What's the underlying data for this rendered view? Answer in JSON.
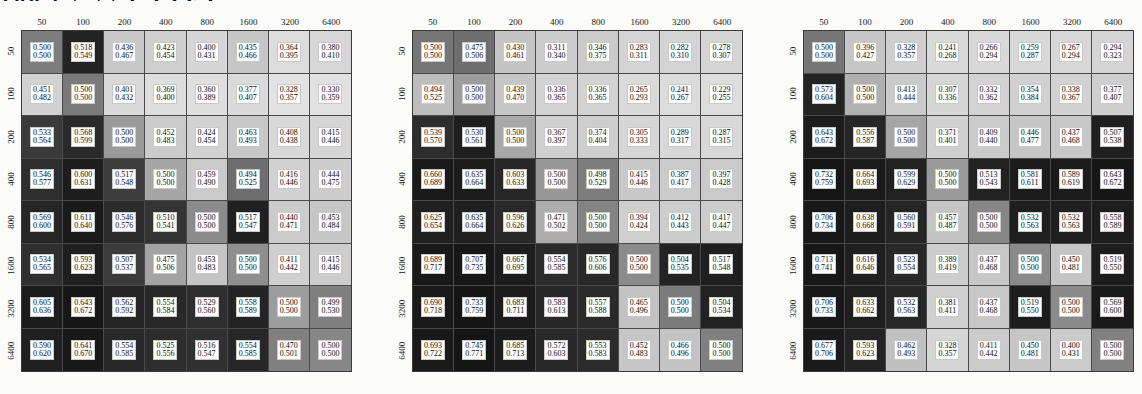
{
  "top_text_fragment": "100   67 77 GTTET",
  "axis": {
    "column_labels": [
      "50",
      "100",
      "200",
      "400",
      "800",
      "1600",
      "3200",
      "6400"
    ],
    "row_labels": [
      "50",
      "100",
      "200",
      "400",
      "800",
      "1600",
      "3200",
      "6400"
    ]
  },
  "chart_data": [
    {
      "type": "heatmap",
      "title": "",
      "xlabel": "",
      "ylabel": "",
      "categories": [
        "50",
        "100",
        "200",
        "400",
        "800",
        "1600",
        "3200",
        "6400"
      ],
      "rows": [
        "50",
        "100",
        "200",
        "400",
        "800",
        "1600",
        "3200",
        "6400"
      ],
      "cell_text_top": [
        [
          "0.500",
          "0.518",
          "0.436",
          "0.423",
          "0.400",
          "0.435",
          "0.364",
          "0.380"
        ],
        [
          "0.451",
          "0.500",
          "0.401",
          "0.369",
          "0.360",
          "0.377",
          "0.328",
          "0.330"
        ],
        [
          "0.533",
          "0.568",
          "0.500",
          "0.452",
          "0.424",
          "0.463",
          "0.408",
          "0.415"
        ],
        [
          "0.546",
          "0.600",
          "0.517",
          "0.500",
          "0.459",
          "0.494",
          "0.416",
          "0.444"
        ],
        [
          "0.569",
          "0.611",
          "0.546",
          "0.510",
          "0.500",
          "0.517",
          "0.440",
          "0.453"
        ],
        [
          "0.534",
          "0.593",
          "0.507",
          "0.475",
          "0.453",
          "0.500",
          "0.411",
          "0.415"
        ],
        [
          "0.605",
          "0.643",
          "0.562",
          "0.554",
          "0.529",
          "0.558",
          "0.500",
          "0.499"
        ],
        [
          "0.590",
          "0.641",
          "0.554",
          "0.525",
          "0.516",
          "0.554",
          "0.470",
          "0.500"
        ]
      ],
      "cell_text_bottom": [
        [
          "0.500",
          "0.549",
          "0.467",
          "0.454",
          "0.431",
          "0.466",
          "0.395",
          "0.410"
        ],
        [
          "0.482",
          "0.500",
          "0.432",
          "0.400",
          "0.389",
          "0.407",
          "0.357",
          "0.359"
        ],
        [
          "0.564",
          "0.599",
          "0.500",
          "0.483",
          "0.454",
          "0.493",
          "0.438",
          "0.446"
        ],
        [
          "0.577",
          "0.631",
          "0.548",
          "0.500",
          "0.490",
          "0.525",
          "0.446",
          "0.475"
        ],
        [
          "0.600",
          "0.640",
          "0.576",
          "0.541",
          "0.500",
          "0.547",
          "0.471",
          "0.484"
        ],
        [
          "0.565",
          "0.623",
          "0.537",
          "0.506",
          "0.483",
          "0.500",
          "0.442",
          "0.446"
        ],
        [
          "0.636",
          "0.672",
          "0.592",
          "0.584",
          "0.560",
          "0.589",
          "0.500",
          "0.530"
        ],
        [
          "0.620",
          "0.670",
          "0.585",
          "0.556",
          "0.547",
          "0.585",
          "0.501",
          "0.500"
        ]
      ],
      "cell_colors": [
        [
          "#7d7d7d",
          "#232323",
          "#c8c8c8",
          "#cfcfcf",
          "#d6d6d6",
          "#c6c6c6",
          "#dcdcdc",
          "#d7d7d7"
        ],
        [
          "#d2d2d2",
          "#7a7a7a",
          "#d9d9d9",
          "#dedede",
          "#dfdfdf",
          "#dadada",
          "#e2e2e2",
          "#e1e1e1"
        ],
        [
          "#3a3a3a",
          "#2a2a2a",
          "#9a9a9a",
          "#cbcbcb",
          "#d2d2d2",
          "#c7c7c7",
          "#d8d8d8",
          "#d5d5d5"
        ],
        [
          "#2e2e2e",
          "#1d1d1d",
          "#3e3e3e",
          "#a6a6a6",
          "#cacaca",
          "#6e6e6e",
          "#d2d2d2",
          "#cdcdcd"
        ],
        [
          "#262626",
          "#1a1a1a",
          "#2b2b2b",
          "#343434",
          "#8b8b8b",
          "#202020",
          "#cbcbcb",
          "#c6c6c6"
        ],
        [
          "#2f2f2f",
          "#1f1f1f",
          "#3b3b3b",
          "#a3a3a3",
          "#c4c4c4",
          "#8e8e8e",
          "#cfcfcf",
          "#cccccc"
        ],
        [
          "#1c1c1c",
          "#171717",
          "#252525",
          "#282828",
          "#2e2e2e",
          "#242424",
          "#9d9d9d",
          "#7f7f7f"
        ],
        [
          "#202020",
          "#181818",
          "#292929",
          "#2d2d2d",
          "#303030",
          "#272727",
          "#808080",
          "#878787"
        ]
      ]
    },
    {
      "type": "heatmap",
      "title": "",
      "xlabel": "",
      "ylabel": "",
      "categories": [
        "50",
        "100",
        "200",
        "400",
        "800",
        "1600",
        "3200",
        "6400"
      ],
      "rows": [
        "50",
        "100",
        "200",
        "400",
        "800",
        "1600",
        "3200",
        "6400"
      ],
      "cell_text_top": [
        [
          "0.500",
          "0.475",
          "0.430",
          "0.311",
          "0.346",
          "0.283",
          "0.282",
          "0.278"
        ],
        [
          "0.494",
          "0.500",
          "0.439",
          "0.336",
          "0.336",
          "0.265",
          "0.241",
          "0.229"
        ],
        [
          "0.539",
          "0.530",
          "0.500",
          "0.367",
          "0.374",
          "0.305",
          "0.289",
          "0.287"
        ],
        [
          "0.660",
          "0.635",
          "0.603",
          "0.500",
          "0.498",
          "0.415",
          "0.387",
          "0.397"
        ],
        [
          "0.625",
          "0.635",
          "0.596",
          "0.471",
          "0.500",
          "0.394",
          "0.412",
          "0.417"
        ],
        [
          "0.689",
          "0.707",
          "0.667",
          "0.554",
          "0.576",
          "0.500",
          "0.504",
          "0.517"
        ],
        [
          "0.690",
          "0.733",
          "0.683",
          "0.583",
          "0.557",
          "0.465",
          "0.500",
          "0.504"
        ],
        [
          "0.693",
          "0.745",
          "0.685",
          "0.572",
          "0.553",
          "0.452",
          "0.466",
          "0.500"
        ]
      ],
      "cell_text_bottom": [
        [
          "0.500",
          "0.506",
          "0.461",
          "0.340",
          "0.375",
          "0.311",
          "0.310",
          "0.307"
        ],
        [
          "0.525",
          "0.500",
          "0.470",
          "0.365",
          "0.365",
          "0.293",
          "0.267",
          "0.255"
        ],
        [
          "0.570",
          "0.561",
          "0.500",
          "0.397",
          "0.404",
          "0.333",
          "0.317",
          "0.315"
        ],
        [
          "0.689",
          "0.664",
          "0.633",
          "0.500",
          "0.529",
          "0.446",
          "0.417",
          "0.428"
        ],
        [
          "0.654",
          "0.664",
          "0.626",
          "0.502",
          "0.500",
          "0.424",
          "0.443",
          "0.447"
        ],
        [
          "0.717",
          "0.735",
          "0.695",
          "0.585",
          "0.606",
          "0.500",
          "0.535",
          "0.548"
        ],
        [
          "0.718",
          "0.759",
          "0.711",
          "0.613",
          "0.588",
          "0.496",
          "0.500",
          "0.534"
        ],
        [
          "0.722",
          "0.771",
          "0.713",
          "0.603",
          "0.583",
          "0.483",
          "0.496",
          "0.500"
        ]
      ],
      "cell_colors": [
        [
          "#767676",
          "#6e6e6e",
          "#c5c5c5",
          "#cdcdcd",
          "#cacaca",
          "#d4d4d4",
          "#d4d4d4",
          "#d5d5d5"
        ],
        [
          "#bdbdbd",
          "#9d9d9d",
          "#c6c6c6",
          "#d3d3d3",
          "#d3d3d3",
          "#dadada",
          "#dcdcdc",
          "#dddddd"
        ],
        [
          "#2d2d2d",
          "#1e1e1e",
          "#a8a8a8",
          "#cfcfcf",
          "#cecece",
          "#d6d6d6",
          "#d8d8d8",
          "#d8d8d8"
        ],
        [
          "#1a1a1a",
          "#1c1c1c",
          "#272727",
          "#989898",
          "#7d7d7d",
          "#c8c8c8",
          "#cbcbcb",
          "#cacaca"
        ],
        [
          "#202020",
          "#1f1f1f",
          "#292929",
          "#adadad",
          "#838383",
          "#cfcfcf",
          "#cdcdcd",
          "#cccccc"
        ],
        [
          "#191919",
          "#171717",
          "#1d1d1d",
          "#2b2b2b",
          "#282828",
          "#8b8b8b",
          "#232323",
          "#1f1f1f"
        ],
        [
          "#191919",
          "#151515",
          "#1c1c1c",
          "#272727",
          "#2a2a2a",
          "#c2c2c2",
          "#7b7b7b",
          "#222222"
        ],
        [
          "#191919",
          "#141414",
          "#1c1c1c",
          "#292929",
          "#2b2b2b",
          "#c6c6c6",
          "#c3c3c3",
          "#808080"
        ]
      ]
    },
    {
      "type": "heatmap",
      "title": "",
      "xlabel": "",
      "ylabel": "",
      "categories": [
        "50",
        "100",
        "200",
        "400",
        "800",
        "1600",
        "3200",
        "6400"
      ],
      "rows": [
        "50",
        "100",
        "200",
        "400",
        "800",
        "1600",
        "3200",
        "6400"
      ],
      "cell_text_top": [
        [
          "0.500",
          "0.396",
          "0.328",
          "0.241",
          "0.266",
          "0.259",
          "0.267",
          "0.294"
        ],
        [
          "0.573",
          "0.500",
          "0.413",
          "0.307",
          "0.332",
          "0.354",
          "0.338",
          "0.377"
        ],
        [
          "0.643",
          "0.556",
          "0.500",
          "0.371",
          "0.409",
          "0.446",
          "0.437",
          "0.507"
        ],
        [
          "0.732",
          "0.664",
          "0.599",
          "0.500",
          "0.513",
          "0.581",
          "0.589",
          "0.643"
        ],
        [
          "0.706",
          "0.638",
          "0.560",
          "0.457",
          "0.500",
          "0.532",
          "0.532",
          "0.558"
        ],
        [
          "0.713",
          "0.616",
          "0.523",
          "0.389",
          "0.437",
          "0.500",
          "0.450",
          "0.519"
        ],
        [
          "0.706",
          "0.633",
          "0.532",
          "0.381",
          "0.437",
          "0.519",
          "0.500",
          "0.569"
        ],
        [
          "0.677",
          "0.593",
          "0.462",
          "0.328",
          "0.411",
          "0.450",
          "0.400",
          "0.500"
        ]
      ],
      "cell_text_bottom": [
        [
          "0.500",
          "0.427",
          "0.357",
          "0.268",
          "0.294",
          "0.287",
          "0.294",
          "0.323"
        ],
        [
          "0.604",
          "0.500",
          "0.444",
          "0.336",
          "0.362",
          "0.384",
          "0.367",
          "0.407"
        ],
        [
          "0.672",
          "0.587",
          "0.500",
          "0.401",
          "0.440",
          "0.477",
          "0.468",
          "0.538"
        ],
        [
          "0.759",
          "0.693",
          "0.629",
          "0.500",
          "0.543",
          "0.611",
          "0.619",
          "0.672"
        ],
        [
          "0.734",
          "0.668",
          "0.591",
          "0.487",
          "0.500",
          "0.563",
          "0.563",
          "0.589"
        ],
        [
          "0.741",
          "0.646",
          "0.554",
          "0.419",
          "0.468",
          "0.500",
          "0.481",
          "0.550"
        ],
        [
          "0.733",
          "0.662",
          "0.563",
          "0.411",
          "0.468",
          "0.550",
          "0.500",
          "0.600"
        ],
        [
          "0.706",
          "0.623",
          "0.493",
          "0.357",
          "0.442",
          "0.481",
          "0.431",
          "0.500"
        ]
      ],
      "cell_colors": [
        [
          "#767676",
          "#c6c6c6",
          "#cfcfcf",
          "#dadada",
          "#d8d8d8",
          "#d8d8d8",
          "#d7d7d7",
          "#d4d4d4"
        ],
        [
          "#232323",
          "#b0b0b0",
          "#cacaca",
          "#d6d6d6",
          "#d3d3d3",
          "#d1d1d1",
          "#d2d2d2",
          "#cecece"
        ],
        [
          "#1c1c1c",
          "#262626",
          "#a5a5a5",
          "#d0d0d0",
          "#cbcbcb",
          "#c6c6c6",
          "#c7c7c7",
          "#1f1f1f"
        ],
        [
          "#161616",
          "#1b1b1b",
          "#212121",
          "#9a9a9a",
          "#222222",
          "#1c1c1c",
          "#1b1b1b",
          "#171717"
        ],
        [
          "#181818",
          "#1d1d1d",
          "#252525",
          "#c4c4c4",
          "#868686",
          "#1f1f1f",
          "#1f1f1f",
          "#1d1d1d"
        ],
        [
          "#171717",
          "#1f1f1f",
          "#282828",
          "#cdcdcd",
          "#c7c7c7",
          "#8a8a8a",
          "#c5c5c5",
          "#1d1d1d"
        ],
        [
          "#181818",
          "#1e1e1e",
          "#272727",
          "#cfcfcf",
          "#c7c7c7",
          "#1d1d1d",
          "#8a8a8a",
          "#1a1a1a"
        ],
        [
          "#1a1a1a",
          "#232323",
          "#c0c0c0",
          "#d6d6d6",
          "#cbcbcb",
          "#c6c6c6",
          "#cbcbcb",
          "#818181"
        ]
      ]
    }
  ]
}
